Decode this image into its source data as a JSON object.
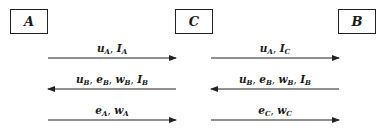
{
  "entities": [
    {
      "id": "A",
      "label": "A"
    },
    {
      "id": "C",
      "label": "C"
    },
    {
      "id": "B",
      "label": "B"
    }
  ],
  "messages": [
    {
      "from": "A",
      "to": "C",
      "direction": "right",
      "label": "u_A, I_A",
      "terms": [
        {
          "v": "u",
          "s": "A"
        },
        {
          "v": "I",
          "s": "A"
        }
      ]
    },
    {
      "from": "C",
      "to": "A",
      "direction": "left",
      "label": "u_B, e_B, w_B, I_B",
      "terms": [
        {
          "v": "u",
          "s": "B"
        },
        {
          "v": "e",
          "s": "B"
        },
        {
          "v": "w",
          "s": "B"
        },
        {
          "v": "I",
          "s": "B"
        }
      ]
    },
    {
      "from": "A",
      "to": "C",
      "direction": "right",
      "label": "e_A, w_A",
      "terms": [
        {
          "v": "e",
          "s": "A"
        },
        {
          "v": "w",
          "s": "A"
        }
      ]
    },
    {
      "from": "C",
      "to": "B",
      "direction": "right",
      "label": "u_A, I_C",
      "terms": [
        {
          "v": "u",
          "s": "A"
        },
        {
          "v": "I",
          "s": "C"
        }
      ]
    },
    {
      "from": "B",
      "to": "C",
      "direction": "left",
      "label": "u_B, e_B, w_B, I_B",
      "terms": [
        {
          "v": "u",
          "s": "B"
        },
        {
          "v": "e",
          "s": "B"
        },
        {
          "v": "w",
          "s": "B"
        },
        {
          "v": "I",
          "s": "B"
        }
      ]
    },
    {
      "from": "C",
      "to": "B",
      "direction": "right",
      "label": "e_C, w_C",
      "terms": [
        {
          "v": "e",
          "s": "C"
        },
        {
          "v": "w",
          "s": "C"
        }
      ]
    }
  ]
}
